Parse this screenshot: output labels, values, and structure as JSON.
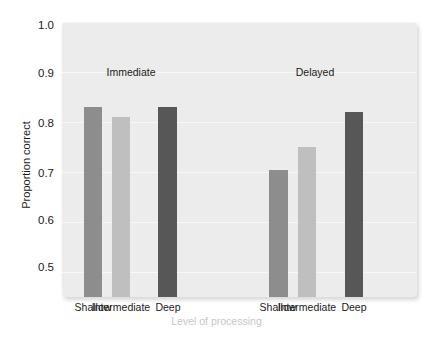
{
  "chart_data": {
    "type": "bar",
    "title": "",
    "xlabel": "Level of processing",
    "ylabel": "Proportion correct",
    "ylim": [
      0.45,
      1.0
    ],
    "yticks": [
      1.0,
      0.9,
      0.8,
      0.7,
      0.6,
      0.5
    ],
    "ytick_labels": [
      "1.0",
      "0.9",
      "0.8",
      "0.7",
      "0.6",
      "0.5"
    ],
    "grid": true,
    "legend": "none",
    "groups": [
      "Immediate",
      "Delayed"
    ],
    "categories": [
      "Shallow",
      "Intermediate",
      "Deep"
    ],
    "series": [
      {
        "name": "Immediate",
        "values": [
          0.83,
          0.81,
          0.83
        ]
      },
      {
        "name": "Delayed",
        "values": [
          0.705,
          0.75,
          0.82
        ]
      }
    ],
    "bar_colors": {
      "Shallow": "#8d8d8d",
      "Intermediate": "#bfbfbf",
      "Deep": "#575757"
    },
    "annotations": [
      {
        "text": "Immediate",
        "x": 0.25,
        "y": 0.91
      },
      {
        "text": "Delayed",
        "x": 0.75,
        "y": 0.91
      }
    ],
    "plot_background": "#ececec",
    "gridline_color": "#f7f7f7"
  },
  "axis": {
    "y_title": "Proportion correct",
    "x_title": "Level of processing",
    "y_ticks": [
      "1.0",
      "0.9",
      "0.8",
      "0.7",
      "0.6",
      "0.5"
    ],
    "x_ticks": [
      "Shallow",
      "Intermediate",
      "Deep",
      "Shallow",
      "Intermediate",
      "Deep"
    ]
  },
  "groups": {
    "immediate": "Immediate",
    "delayed": "Delayed"
  }
}
